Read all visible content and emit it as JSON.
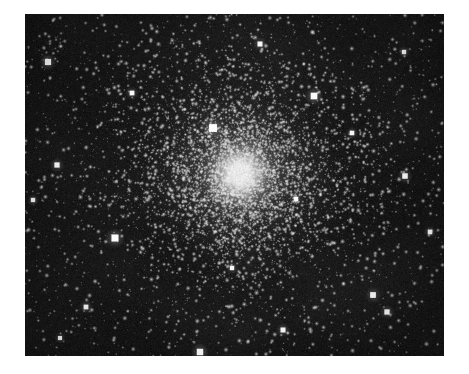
{
  "image": {
    "subject_name": "globular-cluster",
    "caption": "",
    "alt_text": "Astronomical photographic plate of a dense globular star cluster",
    "frame": {
      "x": 25,
      "y": 14,
      "width": 419,
      "height": 342
    },
    "page": {
      "width": 469,
      "height": 374,
      "background": "#ffffff"
    },
    "sky": {
      "background_color": "#141414",
      "background_color_dark": "#0d0d0d",
      "star_color": "#ffffff",
      "grain_opacity": 0.22
    },
    "cluster": {
      "label": "cluster-core",
      "center_x": 240,
      "center_y": 174,
      "core_radius": 26,
      "halo_radius": 118,
      "halo_peak_color": "#f2f2f2",
      "halo_mid_color": "#8a8a8a",
      "core_star_count": 5200,
      "halo_star_count": 3400,
      "field_star_count": 2100
    },
    "bright_stars": [
      {
        "name": "bright-star-core-north",
        "x": 213,
        "y": 128,
        "radius": 3.4,
        "magnitude": 1.0
      },
      {
        "name": "bright-star-west-field",
        "x": 115,
        "y": 238,
        "radius": 3.1,
        "magnitude": 0.95
      },
      {
        "name": "bright-star-northwest",
        "x": 48,
        "y": 62,
        "radius": 2.7,
        "magnitude": 0.9
      },
      {
        "name": "bright-star-northeast",
        "x": 314,
        "y": 96,
        "radius": 2.9,
        "magnitude": 0.95
      },
      {
        "name": "bright-star-south-edge",
        "x": 200,
        "y": 352,
        "radius": 2.8,
        "magnitude": 0.9
      },
      {
        "name": "bright-star-southeast-a",
        "x": 373,
        "y": 295,
        "radius": 2.5,
        "magnitude": 0.85
      },
      {
        "name": "bright-star-southeast-b",
        "x": 387,
        "y": 312,
        "radius": 2.3,
        "magnitude": 0.8
      },
      {
        "name": "bright-star-east-mid",
        "x": 405,
        "y": 176,
        "radius": 2.4,
        "magnitude": 0.82
      },
      {
        "name": "bright-star-west-mid",
        "x": 57,
        "y": 165,
        "radius": 2.3,
        "magnitude": 0.8
      },
      {
        "name": "bright-star-north-center",
        "x": 260,
        "y": 44,
        "radius": 2.2,
        "magnitude": 0.78
      },
      {
        "name": "bright-star-northwest-b",
        "x": 132,
        "y": 93,
        "radius": 2.1,
        "magnitude": 0.75
      },
      {
        "name": "bright-star-southwest",
        "x": 86,
        "y": 307,
        "radius": 2.1,
        "magnitude": 0.75
      },
      {
        "name": "bright-star-south-center",
        "x": 283,
        "y": 330,
        "radius": 2.2,
        "magnitude": 0.78
      },
      {
        "name": "bright-star-east-upper",
        "x": 352,
        "y": 133,
        "radius": 2.0,
        "magnitude": 0.72
      },
      {
        "name": "bright-star-far-east",
        "x": 430,
        "y": 232,
        "radius": 2.0,
        "magnitude": 0.72
      },
      {
        "name": "bright-star-far-west",
        "x": 33,
        "y": 200,
        "radius": 1.9,
        "magnitude": 0.7
      },
      {
        "name": "bright-star-core-east",
        "x": 296,
        "y": 199,
        "radius": 2.0,
        "magnitude": 0.74
      },
      {
        "name": "bright-star-core-south",
        "x": 232,
        "y": 268,
        "radius": 1.9,
        "magnitude": 0.7
      },
      {
        "name": "bright-star-north-east-corner",
        "x": 404,
        "y": 52,
        "radius": 1.9,
        "magnitude": 0.7
      },
      {
        "name": "bright-star-south-west-corner",
        "x": 60,
        "y": 338,
        "radius": 1.8,
        "magnitude": 0.68
      }
    ]
  }
}
